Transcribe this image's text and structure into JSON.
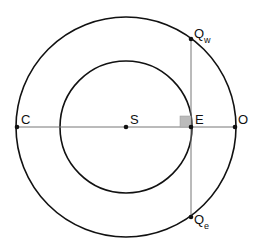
{
  "diagram": {
    "colors": {
      "circle_stroke": "#111111",
      "line_stroke": "#777777",
      "point_fill": "#111111",
      "right_angle_fill": "#bbbbbb"
    },
    "points": {
      "S": {
        "label": "S",
        "x": 126,
        "y": 127
      },
      "C": {
        "label": "C",
        "x": 17,
        "y": 127
      },
      "E": {
        "label": "E",
        "x": 191,
        "y": 127
      },
      "O": {
        "label": "O",
        "x": 235,
        "y": 127
      },
      "Qw": {
        "label": "Q",
        "sub": "w",
        "x": 191,
        "y": 39
      },
      "Qe": {
        "label": "Q",
        "sub": "e",
        "x": 191,
        "y": 217
      }
    },
    "circles": {
      "outer": {
        "cx": 126,
        "cy": 127,
        "r": 110
      },
      "inner": {
        "cx": 126,
        "cy": 127,
        "r": 66
      }
    }
  }
}
